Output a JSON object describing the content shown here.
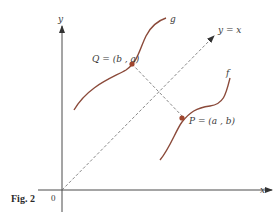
{
  "figure": {
    "caption": "Fig. 2",
    "axes": {
      "x_label": "x",
      "y_label": "y",
      "origin_label": "0"
    },
    "line_label": "y = x",
    "curves": [
      {
        "name": "g",
        "label": "g",
        "color": "#8b4a3a"
      },
      {
        "name": "f",
        "label": "f",
        "color": "#8b4a3a"
      }
    ],
    "points": [
      {
        "name": "Q",
        "label": "Q = (b , a)",
        "color": "#a0462e"
      },
      {
        "name": "P",
        "label": "P = (a , b)",
        "color": "#a0462e"
      }
    ],
    "colors": {
      "axis": "#4a4a4a",
      "curve": "#8b4a3a",
      "dashed": "#6a6a6a",
      "point": "#a0462e"
    }
  }
}
